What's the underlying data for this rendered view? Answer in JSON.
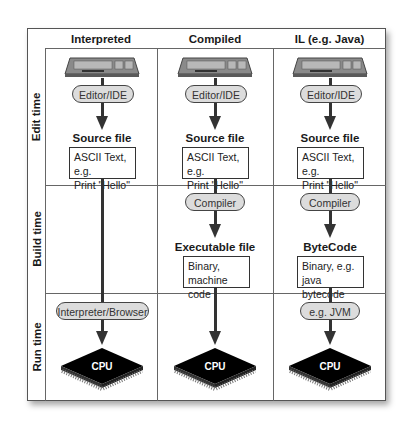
{
  "columns": [
    {
      "label": "Interpreted"
    },
    {
      "label": "Compiled"
    },
    {
      "label": "IL (e.g. Java)"
    }
  ],
  "rows": [
    {
      "label": "Edit time"
    },
    {
      "label": "Build time"
    },
    {
      "label": "Run time"
    }
  ],
  "edit": {
    "tool": "Editor/IDE",
    "output_title": "Source file",
    "output_line1": "ASCII Text, e.g.",
    "output_line2": "Print \"Hello\""
  },
  "build": {
    "compiled": {
      "tool": "Compiler",
      "output_title": "Executable file",
      "output_line1": "Binary,",
      "output_line2": "machine code"
    },
    "il": {
      "tool": "Compiler",
      "output_title": "ByteCode",
      "output_line1": "Binary, e.g.",
      "output_line2": "java bytecode"
    }
  },
  "run": {
    "interpreted_tool": "Interpreter/Browser",
    "il_tool": "e.g. JVM",
    "cpu_label": "CPU"
  },
  "icons": {
    "input_device": "keyboard-icon",
    "processor": "cpu-chip-icon"
  },
  "colors": {
    "pill_fill": "#dcdcdc",
    "line": "#333333",
    "chip": "#000000"
  }
}
